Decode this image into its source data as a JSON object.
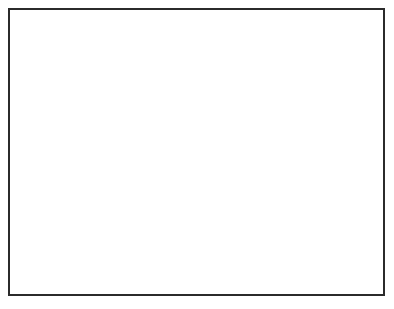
{
  "chart_data": {
    "type": "scatter",
    "title": "Subject NP2",
    "xlabel": "No. of CIS Channels",
    "ylabel": "% Overall IT",
    "xlim": [
      0,
      25
    ],
    "ylim": [
      50,
      100
    ],
    "xticks": [
      0,
      5,
      10,
      15,
      20,
      25
    ],
    "yticks": [
      50,
      60,
      70,
      80,
      90,
      100
    ],
    "grid": false,
    "legend_position": "lower right",
    "series": [
      {
        "name": "male",
        "marker": "filled-circle",
        "linestyle": "solid",
        "color": "#000000",
        "points": [
          {
            "x": 4,
            "y": 86
          },
          {
            "x": 6,
            "y": 87
          },
          {
            "x": 6,
            "y": 91
          },
          {
            "x": 8,
            "y": 87
          },
          {
            "x": 11,
            "y": 88
          }
        ]
      },
      {
        "name": "female",
        "marker": "open-circle",
        "linestyle": "dotted",
        "color": "#7a7a7a",
        "points": [
          {
            "x": 4,
            "y": 75
          },
          {
            "x": 6,
            "y": 73
          },
          {
            "x": 6,
            "y": 84
          },
          {
            "x": 8,
            "y": 76
          },
          {
            "x": 11,
            "y": 81
          }
        ]
      }
    ]
  },
  "legend": {
    "entries": [
      {
        "label": "male"
      },
      {
        "label": "female"
      }
    ]
  },
  "axis_titles": {
    "x": "No. of CIS Channels",
    "y": "% Overall IT"
  },
  "title": "Subject NP2"
}
